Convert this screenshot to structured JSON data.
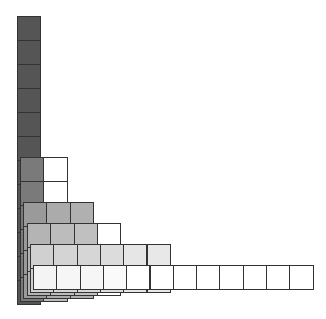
{
  "diagram": {
    "type": "stacked-staircase-grid",
    "cell_width": 23.3,
    "cell_height": 24,
    "border_color": "#333333",
    "layers": [
      {
        "name": "layer-1",
        "cols": 1,
        "rows": 12,
        "left": 17,
        "bottom": 304,
        "fills": [
          [
            "#555555"
          ],
          [
            "#555555"
          ],
          [
            "#555555"
          ],
          [
            "#555555"
          ],
          [
            "#555555"
          ],
          [
            "#555555"
          ],
          [
            "#555555"
          ],
          [
            "#555555"
          ],
          [
            "#555555"
          ],
          [
            "#555555"
          ],
          [
            "#555555"
          ],
          [
            "#555555"
          ]
        ]
      },
      {
        "name": "layer-2",
        "cols": 2,
        "rows": 6,
        "left": 20,
        "bottom": 301,
        "fills": [
          [
            "#7a7a7a",
            "#ffffff"
          ],
          [
            "#7a7a7a",
            "#ffffff"
          ],
          [
            "#7a7a7a",
            "#bdbdbd"
          ],
          [
            "#7a7a7a",
            "#bdbdbd"
          ],
          [
            "#7a7a7a",
            "#bdbdbd"
          ],
          [
            "#7a7a7a",
            "#bdbdbd"
          ]
        ]
      },
      {
        "name": "layer-3",
        "cols": 3,
        "rows": 4,
        "left": 23,
        "bottom": 298,
        "fills": [
          [
            "#9a9a9a",
            "#ababab",
            "#b0b0b0"
          ],
          [
            "#9a9a9a",
            "#ababab",
            "#b0b0b0"
          ],
          [
            "#9a9a9a",
            "#ababab",
            "#b0b0b0"
          ],
          [
            "#9a9a9a",
            "#ababab",
            "#b0b0b0"
          ]
        ]
      },
      {
        "name": "layer-4",
        "cols": 4,
        "rows": 3,
        "left": 27,
        "bottom": 295,
        "fills": [
          [
            "#b4b4b4",
            "#bcbcbc",
            "#c0c0c0",
            "#ffffff"
          ],
          [
            "#b4b4b4",
            "#bcbcbc",
            "#c0c0c0",
            "#ffffff"
          ],
          [
            "#b4b4b4",
            "#bcbcbc",
            "#c0c0c0",
            "#ffffff"
          ]
        ]
      },
      {
        "name": "layer-5",
        "cols": 6,
        "rows": 2,
        "left": 30,
        "bottom": 292,
        "fills": [
          [
            "#d0d0d0",
            "#d4d4d4",
            "#d6d6d6",
            "#dcdcdc",
            "#e6e6e6",
            "#e8e8e8"
          ],
          [
            "#d0d0d0",
            "#d4d4d4",
            "#d6d6d6",
            "#dcdcdc",
            "#e6e6e6",
            "#e8e8e8"
          ]
        ]
      },
      {
        "name": "layer-6",
        "cols": 12,
        "rows": 1,
        "left": 33,
        "bottom": 289,
        "fills": [
          [
            "#f4f4f4",
            "#f6f6f6",
            "#f6f6f6",
            "#fafafa",
            "#ffffff",
            "#ffffff",
            "#ffffff",
            "#ffffff",
            "#ffffff",
            "#ffffff",
            "#ffffff",
            "#ffffff"
          ]
        ]
      }
    ]
  }
}
